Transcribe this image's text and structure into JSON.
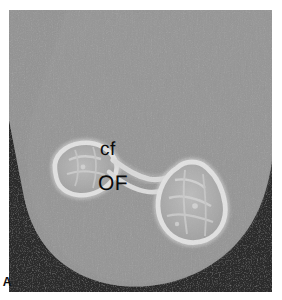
{
  "figure": {
    "panel_letter": "A",
    "modality": "CT",
    "labels": [
      {
        "id": "cf",
        "text": "cf",
        "x": 100,
        "y": 142
      },
      {
        "id": "OF",
        "text": "OF",
        "x": 98,
        "y": 175
      }
    ],
    "colors": {
      "background": "#ffffff",
      "air_dark": "#0d0d0d",
      "soft_tissue_gray": "#9a9a9a",
      "trabecular_gray": "#b4b4b4",
      "cortical_bright": "#f2f2f2",
      "label_text": "#0b0b0b"
    },
    "frame": {
      "x": 9,
      "y": 10,
      "width": 263,
      "height": 282
    }
  }
}
